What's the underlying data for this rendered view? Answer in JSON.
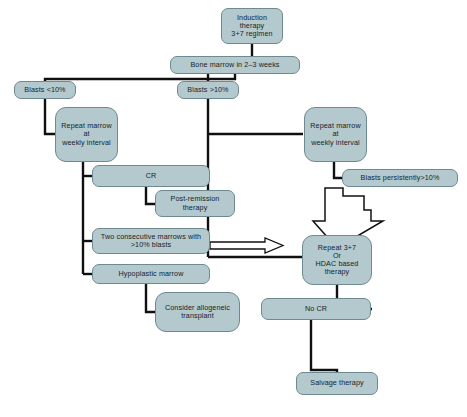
{
  "figure": {
    "background_color": "#ffffff",
    "node_fill_color": "#b3c9ce",
    "node_border_color": "#6e8a90",
    "connector_color": "#101010",
    "hollow_arrow_fill": "#ffffff",
    "hollow_arrow_stroke": "#101010"
  },
  "nodes": [
    {
      "id": "induction",
      "label": "Induction\ntherapy\n3+7 regimen",
      "x": 221,
      "y": 8,
      "w": 62,
      "h": 36
    },
    {
      "id": "bone-marrow",
      "label": "Bone marrow in 2–3 weeks",
      "x": 170,
      "y": 56,
      "w": 130,
      "h": 18
    },
    {
      "id": "blasts-low",
      "label": "Blasts <10%",
      "x": 14,
      "y": 81,
      "w": 62,
      "h": 18
    },
    {
      "id": "blasts-high",
      "label": "Blasts >10%",
      "x": 177,
      "y": 81,
      "w": 62,
      "h": 18
    },
    {
      "id": "repeat-marrow-left",
      "label": "Repeat marrow\nat\nweekly interval",
      "x": 55,
      "y": 107,
      "w": 63,
      "h": 55
    },
    {
      "id": "repeat-marrow-right",
      "label": "Repeat marrow\nat\nweekly interval",
      "x": 304,
      "y": 107,
      "w": 63,
      "h": 55
    },
    {
      "id": "cr",
      "label": "CR",
      "x": 92,
      "y": 165,
      "w": 118,
      "h": 22
    },
    {
      "id": "post-remission",
      "label": "Post-remission\ntherapy",
      "x": 155,
      "y": 190,
      "w": 80,
      "h": 27
    },
    {
      "id": "blasts-persist",
      "label": "Blasts persistently>10%",
      "x": 342,
      "y": 169,
      "w": 116,
      "h": 18
    },
    {
      "id": "two-marrows",
      "label": "Two consecutive marrows with\n>10% blasts",
      "x": 92,
      "y": 228,
      "w": 118,
      "h": 26
    },
    {
      "id": "hypoplastic",
      "label": "Hypoplastic marrow",
      "x": 92,
      "y": 264,
      "w": 118,
      "h": 20
    },
    {
      "id": "repeat-3-7",
      "label": "Repeat 3+7\nOr\nHDAC based\ntherapy",
      "x": 302,
      "y": 235,
      "w": 70,
      "h": 50
    },
    {
      "id": "consider-allo",
      "label": "Consider allogeneic\ntransplant",
      "x": 155,
      "y": 292,
      "w": 85,
      "h": 40
    },
    {
      "id": "no-cr",
      "label": "No CR",
      "x": 261,
      "y": 298,
      "w": 110,
      "h": 22
    },
    {
      "id": "salvage",
      "label": "Salvage therapy",
      "x": 296,
      "y": 372,
      "w": 82,
      "h": 23
    }
  ],
  "connectors": [
    {
      "id": "induction-to-bone-marrow",
      "from": "induction",
      "to": "bone-marrow"
    },
    {
      "id": "bone-marrow-to-blasts-low",
      "from": "bone-marrow",
      "to": "blasts-low"
    },
    {
      "id": "bone-marrow-to-blasts-high",
      "from": "bone-marrow",
      "to": "blasts-high"
    },
    {
      "id": "blasts-low-to-repeat-marrow",
      "from": "blasts-low",
      "to": "repeat-marrow-left"
    },
    {
      "id": "blasts-high-to-repeat-marrow",
      "from": "blasts-high",
      "to": "repeat-marrow-right"
    },
    {
      "id": "repeat-marrow-left-to-cr",
      "from": "repeat-marrow-left",
      "to": "cr"
    },
    {
      "id": "repeat-marrow-left-to-two",
      "from": "repeat-marrow-left",
      "to": "two-marrows"
    },
    {
      "id": "repeat-marrow-left-to-hypo",
      "from": "repeat-marrow-left",
      "to": "hypoplastic"
    },
    {
      "id": "cr-to-post-remission",
      "from": "cr",
      "to": "post-remission"
    },
    {
      "id": "repeat-marrow-right-to-persist",
      "from": "repeat-marrow-right",
      "to": "blasts-persist"
    },
    {
      "id": "persist-to-repeat-3-7",
      "from": "blasts-persist",
      "to": "repeat-3-7",
      "style": "hollow-arrow"
    },
    {
      "id": "two-marrows-to-repeat-3-7",
      "from": "two-marrows",
      "to": "repeat-3-7",
      "style": "hollow-arrow"
    },
    {
      "id": "blasts-high-to-repeat-3-7",
      "from": "blasts-high",
      "to": "repeat-3-7"
    },
    {
      "id": "hypoplastic-to-consider-allo",
      "from": "hypoplastic",
      "to": "consider-allo"
    },
    {
      "id": "repeat-3-7-to-no-cr",
      "from": "repeat-3-7",
      "to": "no-cr"
    },
    {
      "id": "no-cr-to-salvage",
      "from": "no-cr",
      "to": "salvage"
    }
  ]
}
